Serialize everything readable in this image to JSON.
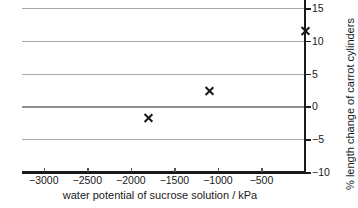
{
  "chart_data": {
    "type": "scatter",
    "title": "",
    "xlabel": "water potential of sucrose solution / kPa",
    "ylabel": "% length change of carrot cylinders",
    "xlim": [
      -3250,
      0
    ],
    "ylim": [
      -10,
      15
    ],
    "grid": true,
    "legend": null,
    "xticks": [
      -3000,
      -2500,
      -2000,
      -1500,
      -1000,
      -500
    ],
    "xticklabels": [
      "−3000",
      "−2500",
      "−2000",
      "−1500",
      "−1000",
      "−500"
    ],
    "yticks": [
      15,
      10,
      5,
      0,
      -5,
      -10
    ],
    "yticklabels": [
      "15",
      "10",
      "5",
      "0",
      "−5",
      "−10"
    ],
    "gridlines_y": [
      15,
      10,
      5,
      0,
      -5
    ],
    "y_axis_position": "right",
    "marker": "x",
    "marker_color": "#1a1a1a",
    "points": [
      {
        "x": -1800,
        "y": -1.8
      },
      {
        "x": -1100,
        "y": 2.3
      },
      {
        "x": 0,
        "y": 11.5
      }
    ],
    "series": [
      {
        "name": "carrot cylinder length change",
        "x": [
          -1800,
          -1100,
          0
        ],
        "values": [
          -1.8,
          2.3,
          11.5
        ]
      }
    ]
  },
  "colors": {
    "axis": "#1a1a1a",
    "gridline": "#a8a8a8",
    "gridline_zero": "#909090",
    "background": "#ffffff",
    "marker": "#1a1a1a"
  }
}
